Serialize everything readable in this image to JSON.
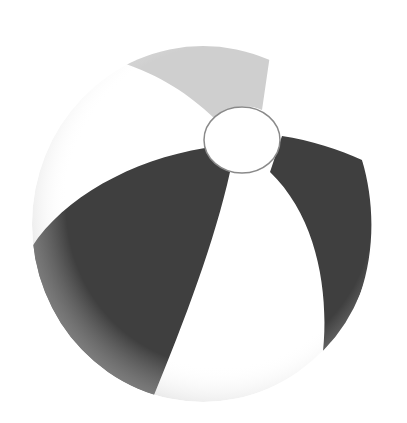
{
  "image": {
    "subject": "beach ball",
    "colors": {
      "background": "#ffffff",
      "dark_panel": "#3f3f3f",
      "light_gray_panel": "#cfcfcf",
      "white_panel": "#ffffff",
      "edge_shade": "#d8d8d8",
      "cap_outline": "#8a8a8a"
    }
  }
}
